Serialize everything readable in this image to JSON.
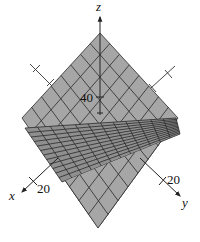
{
  "figure": {
    "type": "3d-surface-plot",
    "surface_color": "#a6a6a6",
    "surface_dark_color": "#8f8f8f",
    "grid_line_color": "#2a2a2a",
    "axis_color": "#222222"
  },
  "axes": {
    "x": {
      "label": "x",
      "tick_label": "20"
    },
    "y": {
      "label": "y",
      "tick_label": "20"
    },
    "z": {
      "label": "z",
      "tick_label": "40"
    }
  },
  "surfaces": [
    {
      "name": "steep-plane",
      "grid_divisions": 8
    },
    {
      "name": "shallow-plane",
      "grid_divisions": 12
    }
  ]
}
